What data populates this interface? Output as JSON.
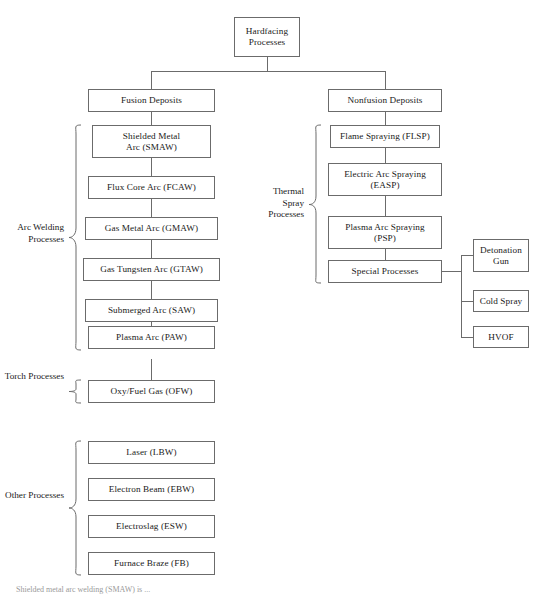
{
  "diagram": {
    "root": {
      "label": "Hardfacing\nProcesses"
    },
    "branches": [
      {
        "id": "fusion",
        "label": "Fusion Deposits"
      },
      {
        "id": "nonfusion",
        "label": "Nonfusion Deposits"
      }
    ],
    "groups": [
      {
        "id": "arc-welding",
        "label": "Arc Welding\nProcesses"
      },
      {
        "id": "torch",
        "label": "Torch\nProcesses"
      },
      {
        "id": "other",
        "label": "Other\nProcesses"
      },
      {
        "id": "thermal-spray",
        "label": "Thermal\nSpray\nProcesses"
      }
    ],
    "nodes": {
      "root": "Hardfacing Processes",
      "fusion_deposits": "Fusion Deposits",
      "nonfusion_deposits": "Nonfusion Deposits",
      "smaw": "Shielded Metal Arc (SMAW)",
      "fcaw": "Flux Core Arc (FCAW)",
      "gmaw": "Gas Metal Arc (GMAW)",
      "gtaw": "Gas Tungsten Arc (GTAW)",
      "saw": "Submerged Arc (SAW)",
      "paw": "Plasma Arc (PAW)",
      "ofw": "Oxy/Fuel Gas (OFW)",
      "lbw": "Laser (LBW)",
      "ebw": "Electron Beam (EBW)",
      "esw": "Electroslag (ESW)",
      "fb": "Furnace Braze (FB)",
      "flsp": "Flame Spraying (FLSP)",
      "easp": "Electric Arc Spraying (EASP)",
      "psp": "Plasma Arc Spraying (PSP)",
      "special": "Special Processes",
      "detonation_gun": "Detonation Gun",
      "cold_spray": "Cold Spray",
      "hvof": "HVOF"
    },
    "node_lines": {
      "root_l1": "Hardfacing",
      "root_l2": "Processes",
      "smaw_l1": "Shielded Metal",
      "smaw_l2": "Arc (SMAW)",
      "easp_l1": "Electric Arc Spraying",
      "easp_l2": "(EASP)",
      "psp_l1": "Plasma Arc Spraying",
      "psp_l2": "(PSP)",
      "detonation_l1": "Detonation",
      "detonation_l2": "Gun",
      "arc_welding_l1": "Arc Welding",
      "arc_welding_l2": "Processes",
      "torch_l1": "Torch",
      "torch_l2": "Processes",
      "other_l1": "Other",
      "other_l2": "Processes",
      "thermal_l1": "Thermal",
      "thermal_l2": "Spray",
      "thermal_l3": "Processes"
    },
    "caption": "Shielded metal arc welding (SMAW) is ..."
  },
  "colors": {
    "box_border": "#6b6b6b",
    "text": "#1a1a1a",
    "background": "#ffffff",
    "caption": "#9a9a9a"
  }
}
